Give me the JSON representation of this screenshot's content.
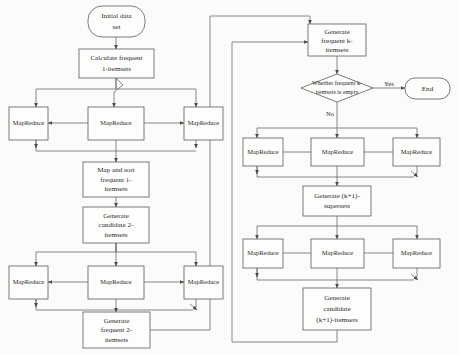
{
  "diagram": {
    "colors": {
      "background": "#fbfbfa",
      "node_fill": "#fdfdfc",
      "node_stroke": "#5a5a5a",
      "connector": "#6b6b6b",
      "text": "#2b2b2b"
    },
    "nodes": {
      "initial_data_set": {
        "label": "Initial data set",
        "lines": [
          "Initial data",
          "set"
        ],
        "shape": "terminator"
      },
      "calculate_frequent_1": {
        "label": "Calculate frequent 1-itemsets",
        "lines": [
          "Calculate frequent",
          "1-itemsets"
        ],
        "shape": "process"
      },
      "mapreduce_r1_left": {
        "label": "MapReduce",
        "shape": "process"
      },
      "mapreduce_r1_center": {
        "label": "MapReduce",
        "shape": "process"
      },
      "mapreduce_r1_right": {
        "label": "MapReduce",
        "shape": "process"
      },
      "map_and_sort_frequent_1": {
        "label": "Map and sort frequent 1-itemsets",
        "lines": [
          "Map and sort",
          "frequent 1-",
          "itemsets"
        ],
        "shape": "process"
      },
      "generate_candidate_2": {
        "label": "Generate candidate 2-itemsets",
        "lines": [
          "Generate",
          "candidate 2-",
          "itemsets"
        ],
        "shape": "process"
      },
      "mapreduce_r2_left": {
        "label": "MapReduce",
        "shape": "process"
      },
      "mapreduce_r2_center": {
        "label": "MapReduce",
        "shape": "process"
      },
      "mapreduce_r2_right": {
        "label": "MapReduce",
        "shape": "process"
      },
      "generate_frequent_2": {
        "label": "Generate frequent 2-itemsets",
        "lines": [
          "Generate",
          "frequent 2-",
          "itemsets"
        ],
        "shape": "process"
      },
      "generate_frequent_k": {
        "label": "Generate frequent k-itemsets",
        "lines": [
          "Generate",
          "frequent k-",
          "itemsets"
        ],
        "shape": "process"
      },
      "whether_empty": {
        "label": "Whether frequent k-itemsets is empty",
        "lines": [
          "Whether frequent k-",
          "itemsets is empty"
        ],
        "shape": "decision"
      },
      "end": {
        "label": "End",
        "shape": "terminator"
      },
      "mapreduce_r3_left": {
        "label": "MapReduce",
        "shape": "process"
      },
      "mapreduce_r3_center": {
        "label": "MapReduce",
        "shape": "process"
      },
      "mapreduce_r3_right": {
        "label": "MapReduce",
        "shape": "process"
      },
      "generate_k1_supersets": {
        "label": "Generate (k+1)-supersets",
        "lines": [
          "Generate (k+1)-",
          "supersets"
        ],
        "shape": "process"
      },
      "mapreduce_r4_left": {
        "label": "MapReduce",
        "shape": "process"
      },
      "mapreduce_r4_center": {
        "label": "MapReduce",
        "shape": "process"
      },
      "mapreduce_r4_right": {
        "label": "MapReduce",
        "shape": "process"
      },
      "generate_candidate_k1": {
        "label": "Generate candidate (k+1)-itemsets",
        "lines": [
          "Generate",
          "candidate",
          "(k+1)-itemsets"
        ],
        "shape": "process"
      }
    },
    "edge_labels": {
      "yes": "Yes",
      "no": "No"
    }
  }
}
